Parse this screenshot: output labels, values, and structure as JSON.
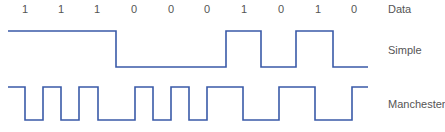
{
  "diagram": {
    "row_labels": {
      "data": "Data",
      "simple": "Simple",
      "manchester": "Manchester"
    },
    "bits": [
      "1",
      "1",
      "1",
      "0",
      "0",
      "0",
      "1",
      "0",
      "1",
      "0"
    ],
    "bit_label_x": [
      25,
      61,
      97,
      134,
      171,
      207,
      244,
      281,
      318,
      354
    ],
    "colors": {
      "waveform": "#3a5aa8",
      "text": "#555555"
    },
    "simple_waveform": {
      "points": "8,31 116,31 116,67 226,67 226,31 261,31 261,67 296,67 296,31 333,31 333,67 368,67"
    },
    "manchester_waveform": {
      "points": "8,87 25,87 25,120 43,120 43,87 61,87 61,120 79,120 79,87 98,87 98,120 135,120 135,87 153,87 153,120 171,120 171,87 189,87 189,120 207,120 207,87 243,87 243,120 279,120 279,87 315,87 315,120 352,120 352,87 368,87"
    }
  }
}
